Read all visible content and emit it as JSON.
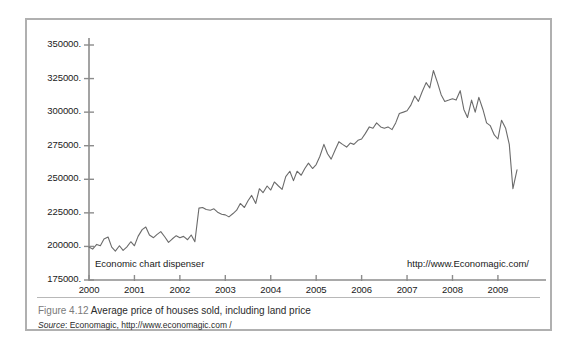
{
  "figure": {
    "caption_number": "Figure 4.12",
    "caption_title": "Average price of houses sold, including land price",
    "source_label": "Source",
    "source_text": ": Economagic, http://www.economagic.com /"
  },
  "watermarks": {
    "left": "Economic chart dispenser",
    "right": "http://www.Economagic.com/"
  },
  "colors": {
    "line": "#6b6b6b",
    "axis": "#8c8c8c",
    "card_border": "#b0b0b0",
    "text": "#1a1a1a",
    "background": "#ffffff"
  },
  "chart_data": {
    "type": "line",
    "title": "Average price of houses sold, including land price",
    "xlabel": "",
    "ylabel": "",
    "xlim": [
      2000.0,
      2009.75
    ],
    "ylim": [
      175000,
      350000
    ],
    "grid": false,
    "legend": null,
    "ytick_labels": [
      "350000.",
      "325000.",
      "300000.",
      "275000.",
      "250000.",
      "225000.",
      "200000.",
      "175000."
    ],
    "ytick_values": [
      350000,
      325000,
      300000,
      275000,
      250000,
      225000,
      200000,
      175000
    ],
    "xtick_labels": [
      "2000",
      "2001",
      "2002",
      "2003",
      "2004",
      "2005",
      "2006",
      "2007",
      "2008",
      "2009"
    ],
    "xtick_values": [
      2000,
      2001,
      2002,
      2003,
      2004,
      2005,
      2006,
      2007,
      2008,
      2009
    ],
    "series": [
      {
        "name": "Average price of houses sold",
        "x": [
          2000.0,
          2000.08,
          2000.17,
          2000.25,
          2000.33,
          2000.42,
          2000.5,
          2000.58,
          2000.67,
          2000.75,
          2000.83,
          2000.92,
          2001.0,
          2001.08,
          2001.17,
          2001.25,
          2001.33,
          2001.42,
          2001.5,
          2001.58,
          2001.67,
          2001.75,
          2001.83,
          2001.92,
          2002.0,
          2002.08,
          2002.17,
          2002.25,
          2002.33,
          2002.42,
          2002.5,
          2002.58,
          2002.67,
          2002.75,
          2002.83,
          2002.92,
          2003.0,
          2003.08,
          2003.17,
          2003.25,
          2003.33,
          2003.42,
          2003.5,
          2003.58,
          2003.67,
          2003.75,
          2003.83,
          2003.92,
          2004.0,
          2004.08,
          2004.17,
          2004.25,
          2004.33,
          2004.42,
          2004.5,
          2004.58,
          2004.67,
          2004.75,
          2004.83,
          2004.92,
          2005.0,
          2005.08,
          2005.17,
          2005.25,
          2005.33,
          2005.42,
          2005.5,
          2005.58,
          2005.67,
          2005.75,
          2005.83,
          2005.92,
          2006.0,
          2006.08,
          2006.17,
          2006.25,
          2006.33,
          2006.42,
          2006.5,
          2006.58,
          2006.67,
          2006.75,
          2006.83,
          2006.92,
          2007.0,
          2007.08,
          2007.17,
          2007.25,
          2007.33,
          2007.42,
          2007.5,
          2007.58,
          2007.67,
          2007.75,
          2007.83,
          2007.92,
          2008.0,
          2008.08,
          2008.17,
          2008.25,
          2008.33,
          2008.42,
          2008.5,
          2008.58,
          2008.67,
          2008.75,
          2008.83,
          2008.92,
          2009.0,
          2009.08,
          2009.17,
          2009.25,
          2009.33,
          2009.42
        ],
        "y": [
          199500,
          198000,
          201500,
          200500,
          205500,
          207000,
          199500,
          196500,
          200500,
          197000,
          199500,
          203500,
          200500,
          207500,
          212500,
          214500,
          208500,
          206500,
          209000,
          211000,
          207000,
          203000,
          205500,
          208000,
          206500,
          207500,
          205000,
          208500,
          203500,
          228500,
          229000,
          227500,
          227000,
          228000,
          225500,
          224000,
          223500,
          222000,
          224500,
          227000,
          232000,
          229000,
          234000,
          238000,
          232000,
          243000,
          240000,
          245000,
          242000,
          248000,
          245000,
          242500,
          252000,
          256000,
          249000,
          256000,
          253000,
          258000,
          262000,
          258000,
          261000,
          267000,
          276000,
          269000,
          265000,
          272000,
          278000,
          276000,
          274000,
          277000,
          276000,
          279000,
          280000,
          284000,
          289000,
          288000,
          292000,
          289000,
          288000,
          289000,
          287000,
          292000,
          299000,
          300000,
          301000,
          305000,
          312000,
          308000,
          315000,
          322000,
          318000,
          331000,
          322000,
          313000,
          308000,
          309000,
          310000,
          309000,
          316000,
          302000,
          296000,
          309000,
          300000,
          311000,
          302000,
          292000,
          290000,
          283000,
          280000,
          294000,
          288000,
          276000,
          243000,
          257000
        ]
      }
    ]
  }
}
